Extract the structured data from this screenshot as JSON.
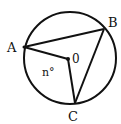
{
  "diagram": {
    "type": "circle-geometry",
    "circle": {
      "cx": 70,
      "cy": 58,
      "r": 46
    },
    "points": {
      "A": {
        "x": 24,
        "y": 47,
        "label": "A"
      },
      "B": {
        "x": 104,
        "y": 29,
        "label": "B"
      },
      "C": {
        "x": 75,
        "y": 103,
        "label": "C"
      },
      "O": {
        "x": 68,
        "y": 59,
        "label": "0"
      }
    },
    "segments": [
      [
        "A",
        "B"
      ],
      [
        "B",
        "C"
      ],
      [
        "A",
        "O"
      ],
      [
        "O",
        "C"
      ]
    ],
    "angle_label": "n°",
    "stroke_color": "#111111"
  }
}
